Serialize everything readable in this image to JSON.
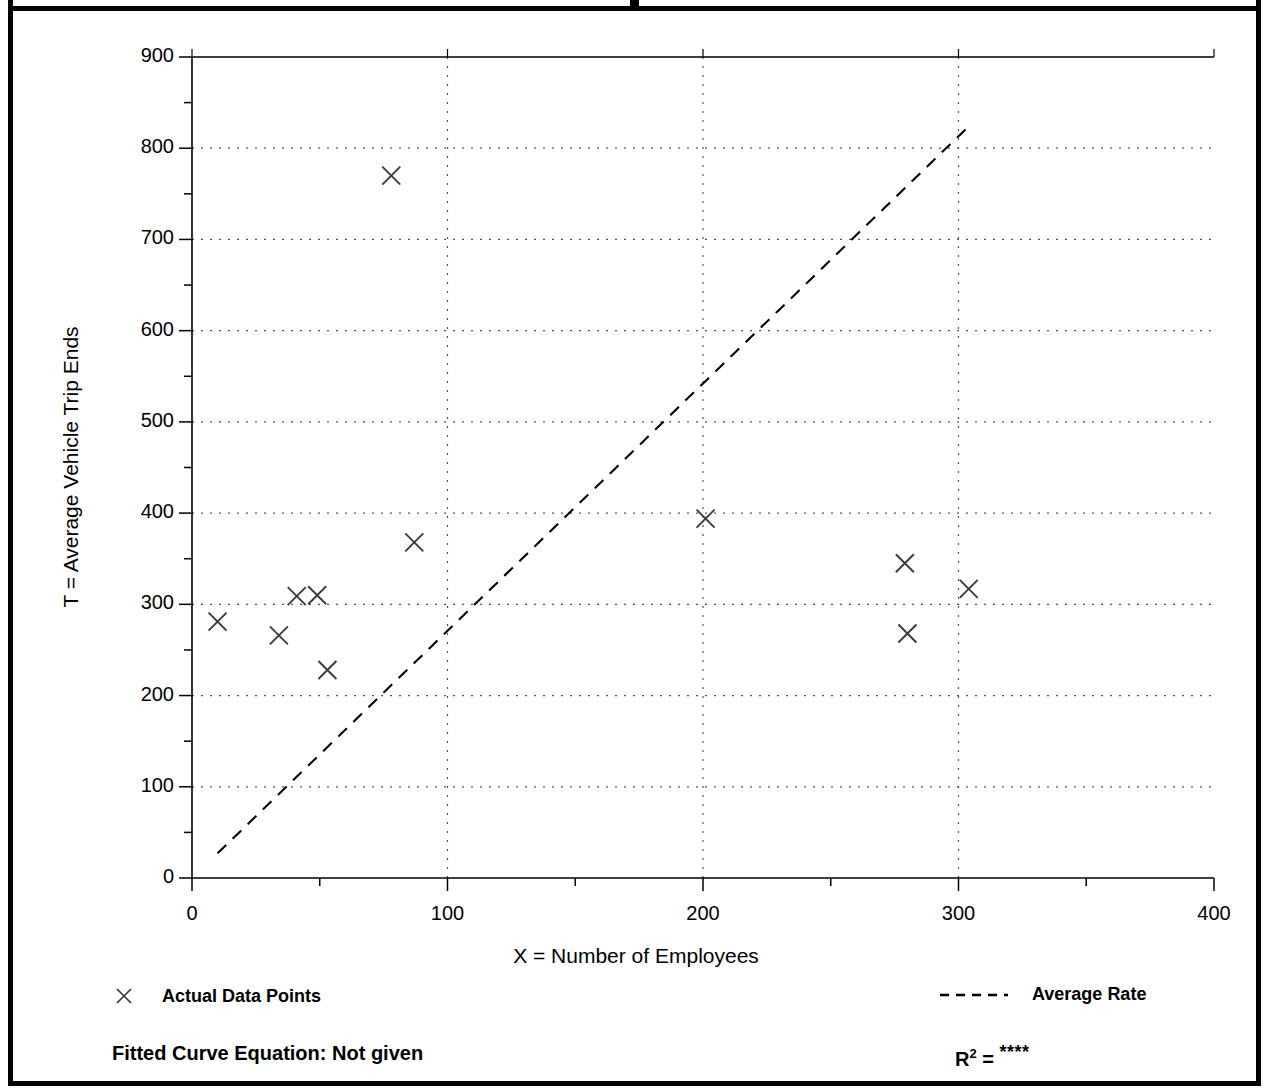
{
  "chart_data": {
    "type": "scatter",
    "title": "",
    "xlabel": "X = Number of Employees",
    "ylabel": "T = Average Vehicle Trip Ends",
    "xlim": [
      0,
      400
    ],
    "ylim": [
      0,
      900
    ],
    "xticks": [
      0,
      100,
      200,
      300,
      400
    ],
    "yticks": [
      0,
      100,
      200,
      300,
      400,
      500,
      600,
      700,
      800,
      900
    ],
    "x_minor_interval": 50,
    "y_minor_interval": 50,
    "grid": "dotted major gridlines on both axes",
    "legend_position": "below-plot",
    "series": [
      {
        "name": "Actual Data Points",
        "type": "scatter",
        "marker": "x",
        "points": [
          {
            "x": 10,
            "y": 281
          },
          {
            "x": 34,
            "y": 266
          },
          {
            "x": 41,
            "y": 309
          },
          {
            "x": 49,
            "y": 310
          },
          {
            "x": 53,
            "y": 228
          },
          {
            "x": 78,
            "y": 770
          },
          {
            "x": 87,
            "y": 368
          },
          {
            "x": 201,
            "y": 394
          },
          {
            "x": 279,
            "y": 345
          },
          {
            "x": 280,
            "y": 268
          },
          {
            "x": 304,
            "y": 317
          }
        ]
      },
      {
        "name": "Average Rate",
        "type": "line",
        "style": "dashed",
        "points": [
          {
            "x": 10,
            "y": 27
          },
          {
            "x": 304,
            "y": 824
          }
        ]
      }
    ]
  },
  "axes": {
    "x_title": "X = Number of Employees",
    "y_title": "T = Average Vehicle Trip Ends",
    "x_tick_labels": [
      "0",
      "100",
      "200",
      "300",
      "400"
    ],
    "y_tick_labels": [
      "0",
      "100",
      "200",
      "300",
      "400",
      "500",
      "600",
      "700",
      "800",
      "900"
    ]
  },
  "legend": {
    "actual_label": "Actual Data Points",
    "actual_marker": "x-marker-icon",
    "average_label": "Average Rate",
    "average_marker": "dashed-line-icon"
  },
  "footnotes": {
    "fitted_equation": "Fitted Curve Equation:  Not given",
    "r_squared_symbol": "R",
    "r_squared_exponent": "2",
    "r_squared_equals": " = ",
    "r_squared_value": "****"
  },
  "colors": {
    "ink": "#000000",
    "background": "#ffffff",
    "grid": "#555555",
    "marker": "#3a3a3a"
  }
}
